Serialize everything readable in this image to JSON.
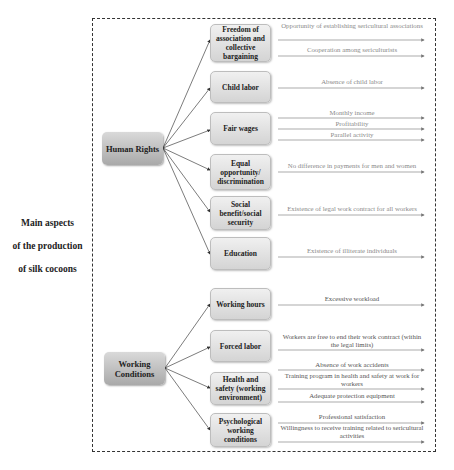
{
  "root": {
    "lines": [
      "Main aspects",
      "of the production",
      "of silk cocoons"
    ]
  },
  "groups": [
    {
      "label": "Human Rights",
      "categories": [
        {
          "label": "Freedom of association and collective bargaining",
          "indicators": [
            "Opportunity of establishing sericultural associations",
            "Cooperation among sericulturists"
          ]
        },
        {
          "label": "Child labor",
          "indicators": [
            "Absence of child labor"
          ]
        },
        {
          "label": "Fair wages",
          "indicators": [
            "Monthly income",
            "Profitability",
            "Parallel activity"
          ]
        },
        {
          "label": "Equal opportunity/ discrimination",
          "indicators": [
            "No difference in payments for men and women"
          ]
        },
        {
          "label": "Social benefit/social security",
          "indicators": [
            "Existence of legal work contract for all workers"
          ]
        },
        {
          "label": "Education",
          "indicators": [
            "Existence of illiterate individuals"
          ]
        }
      ]
    },
    {
      "label": "Working Conditions",
      "categories": [
        {
          "label": "Working hours",
          "indicators": [
            "Excessive workload"
          ]
        },
        {
          "label": "Forced labor",
          "indicators": [
            "Workers are free to end their work contract (within the legal limits)"
          ]
        },
        {
          "label": "Health and safety (working environment)",
          "indicators": [
            "Absence of work accidents",
            "Training program in health and safety at work for workers",
            "Adequate protection equipment"
          ]
        },
        {
          "label": "Psychological working conditions",
          "indicators": [
            "Professional satisfaction",
            "Willingness to receive training related to sericultural activities"
          ]
        }
      ]
    }
  ],
  "colors": {
    "main_box": "#b5b5b5",
    "category_box": "#e0e0e0",
    "indicator_text_hr": "#8a8a8a",
    "indicator_text_wc": "#555555",
    "frame_border": "#333333"
  }
}
